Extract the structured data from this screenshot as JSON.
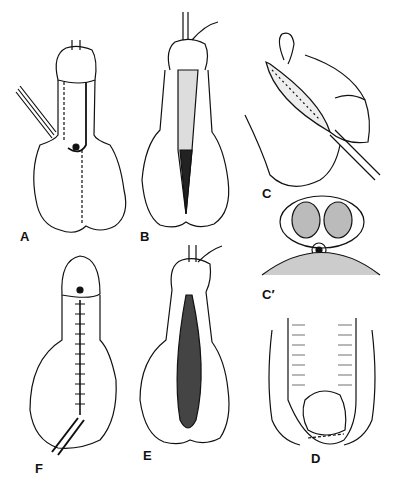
{
  "figure": {
    "panels": [
      {
        "id": "A",
        "label": "A",
        "description": "Ventral view with incision outlined, dashed line along midline to scrotum, instrument retracting"
      },
      {
        "id": "B",
        "label": "B",
        "description": "Urethral plate incised, catheter in place, midline opened"
      },
      {
        "id": "C",
        "label": "C",
        "description": "Lateral view of tube closure with sutures"
      },
      {
        "id": "C2",
        "label": "C′",
        "description": "Cross-section showing corpora and neourethra with catheter"
      },
      {
        "id": "D",
        "label": "D",
        "description": "Dorsal view with dashed line on glans"
      },
      {
        "id": "E",
        "label": "E",
        "description": "Ventral view after tube creation, catheter in place"
      },
      {
        "id": "F",
        "label": "F",
        "description": "Completed repair with midline suture line and catheter exiting"
      }
    ]
  }
}
